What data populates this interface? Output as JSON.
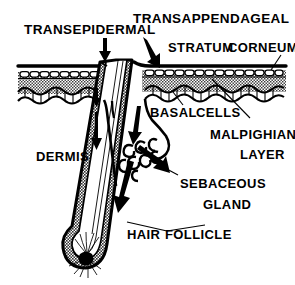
{
  "figure": {
    "background_color": "#ffffff",
    "ink_color": "#000000",
    "stipple_color": "#c9c9c9"
  },
  "labels": {
    "transepidermal": "TRANSEPIDERMAL",
    "transappendageal": "TRANSAPPENDAGEAL",
    "stratum": "STRATUM",
    "corneum": "CORNEUM",
    "basal": "BASAL",
    "cells": "CELLS",
    "malpighian": "MALPIGHIAN",
    "layer": "LAYER",
    "dermis": "DERMIS",
    "sebaceous": "SEBACEOUS",
    "gland": "GLAND",
    "hair": "HAIR",
    "follicle": "FOLLICLE"
  },
  "structures": [
    {
      "name": "stratum-corneum",
      "label": "STRATUM CORNEUM"
    },
    {
      "name": "granular-cell-row",
      "label": "Granular cell row"
    },
    {
      "name": "malpighian-layer",
      "label": "MALPIGHIAN LAYER"
    },
    {
      "name": "basal-cell-row",
      "label": "BASAL CELLS"
    },
    {
      "name": "dermis-region",
      "label": "DERMIS"
    },
    {
      "name": "hair-follicle",
      "label": "HAIR FOLLICLE"
    },
    {
      "name": "hair-shaft",
      "label": "Hair shaft"
    },
    {
      "name": "sebaceous-gland",
      "label": "SEBACEOUS GLAND"
    },
    {
      "name": "hair-bulb-papilla",
      "label": "Hair bulb / dermal papilla"
    }
  ],
  "routes": [
    {
      "name": "transepidermal-route",
      "label": "TRANSEPIDERMAL",
      "direction": "downward through epidermis"
    },
    {
      "name": "transappendageal-route",
      "label": "TRANSAPPENDAGEAL",
      "direction": "downward along hair follicle"
    }
  ]
}
